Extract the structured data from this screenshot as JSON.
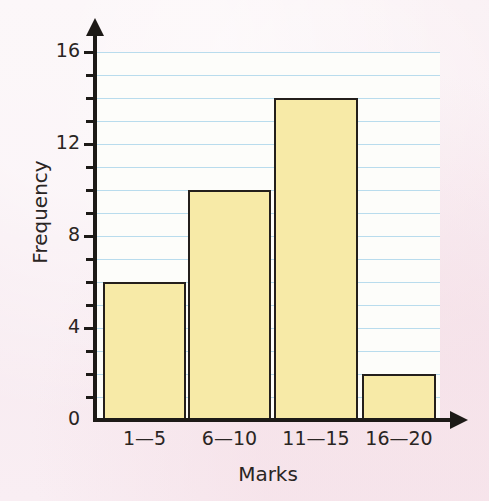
{
  "chart_data": {
    "type": "bar",
    "title": "",
    "subtitle": "",
    "xlabel": "Marks",
    "ylabel": "Frequency",
    "categories": [
      "1—5",
      "6—10",
      "11—15",
      "16—20"
    ],
    "values": [
      6,
      10,
      14,
      2
    ],
    "ylim": [
      0,
      16
    ],
    "y_major_ticks": [
      0,
      4,
      8,
      12,
      16
    ],
    "y_major_tick_labels": [
      "0",
      "4",
      "8",
      "12",
      "16"
    ],
    "y_minor_tick_step": 1,
    "grid": "horizontal",
    "gridline_values": [
      1,
      2,
      3,
      4,
      5,
      6,
      7,
      8,
      9,
      10,
      11,
      12,
      13,
      14,
      15,
      16
    ],
    "legend": null,
    "legend_position": "none",
    "annotations": []
  },
  "style": {
    "page_background": "#f8ecf1",
    "plot_background": "#fdfdfa",
    "gridline_color": "#b9dced",
    "bar_fill": "#f7eaa7",
    "bar_stroke": "#241f1c",
    "axis_color": "#1d1a17",
    "text_color": "#2a2523"
  }
}
